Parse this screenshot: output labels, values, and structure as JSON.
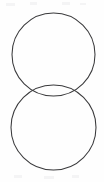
{
  "canvas": {
    "width": 104,
    "height": 182,
    "background_color": "#fefefe",
    "title": "Two overlapping circles diagram"
  },
  "style": {
    "stroke_color": "#3a3a3c",
    "stroke_width": 1.05,
    "fill": "none"
  },
  "chart_data": {
    "type": "diagram",
    "title": "",
    "subtitle": "",
    "xlabel": "",
    "ylabel": "",
    "grid": false,
    "legend": "none",
    "shapes": [
      {
        "name": "upper-circle",
        "kind": "circle",
        "cx": 53.5,
        "cy": 54.5,
        "r": 41.5,
        "stroke": "#3a3a3c",
        "fill": "none"
      },
      {
        "name": "lower-circle",
        "kind": "circle",
        "cx": 53.5,
        "cy": 127.5,
        "r": 42.5,
        "stroke": "#3a3a3c",
        "fill": "none"
      }
    ],
    "intersection_points": [
      {
        "name": "left-intersection",
        "x": 21,
        "y": 89
      },
      {
        "name": "right-intersection",
        "x": 87,
        "y": 89
      }
    ],
    "extents": {
      "left_edge_x": 11,
      "right_edge_x": 96,
      "upper_circle_top_y": 13,
      "upper_circle_bottom_y": 96,
      "lower_circle_top_y": 85,
      "lower_circle_bottom_y": 170
    },
    "annotations": []
  },
  "specks": [
    {
      "name": "speck-a",
      "x": 6,
      "y": 3,
      "w": 9,
      "h": 3
    },
    {
      "name": "speck-b",
      "x": 30,
      "y": 2,
      "w": 7,
      "h": 3
    },
    {
      "name": "speck-c",
      "x": 62,
      "y": 2,
      "w": 8,
      "h": 3
    },
    {
      "name": "speck-d",
      "x": 80,
      "y": 3,
      "w": 6,
      "h": 2
    },
    {
      "name": "speck-e",
      "x": 14,
      "y": 175,
      "w": 8,
      "h": 3
    },
    {
      "name": "speck-f",
      "x": 44,
      "y": 176,
      "w": 10,
      "h": 3
    },
    {
      "name": "speck-g",
      "x": 72,
      "y": 175,
      "w": 7,
      "h": 3
    }
  ]
}
